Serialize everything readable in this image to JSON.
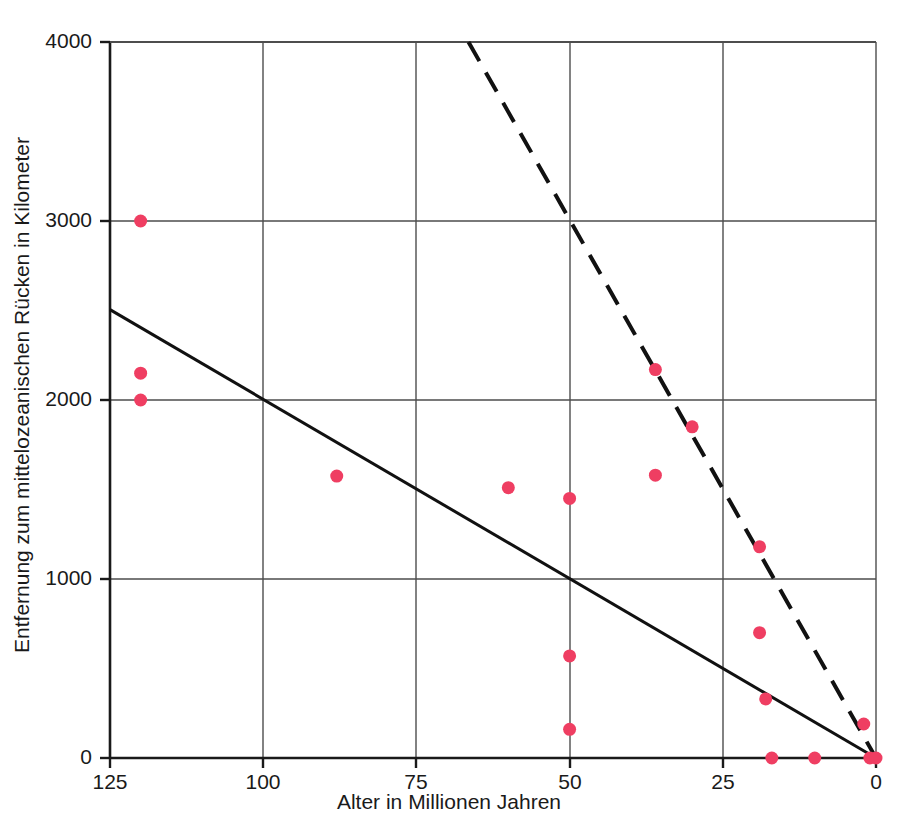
{
  "chart_data": {
    "type": "scatter",
    "title": "",
    "xlabel": "Alter in Millionen Jahren",
    "ylabel": "Entfernung zum mittelozeanischen Rücken in Kilometer",
    "xlim": [
      125,
      0
    ],
    "ylim": [
      0,
      4000
    ],
    "x_reversed": true,
    "grid": true,
    "legend": "none",
    "xticks": [
      125,
      100,
      75,
      50,
      25,
      0
    ],
    "xtick_labels": [
      "125",
      "100",
      "75",
      "50",
      "25",
      "0"
    ],
    "yticks": [
      0,
      1000,
      2000,
      3000,
      4000
    ],
    "ytick_labels": [
      "0",
      "1000",
      "2000",
      "3000",
      "4000"
    ],
    "marker_color": "#EF3E62",
    "marker_size": 13,
    "points": [
      {
        "x": 120,
        "y": 3000
      },
      {
        "x": 120,
        "y": 2150
      },
      {
        "x": 120,
        "y": 2000
      },
      {
        "x": 88,
        "y": 1575
      },
      {
        "x": 60,
        "y": 1510
      },
      {
        "x": 50,
        "y": 1450
      },
      {
        "x": 50,
        "y": 570
      },
      {
        "x": 50,
        "y": 160
      },
      {
        "x": 36,
        "y": 2170
      },
      {
        "x": 36,
        "y": 1580
      },
      {
        "x": 30,
        "y": 1850
      },
      {
        "x": 19,
        "y": 1180
      },
      {
        "x": 19,
        "y": 700
      },
      {
        "x": 18,
        "y": 330
      },
      {
        "x": 17,
        "y": 0
      },
      {
        "x": 10,
        "y": 0
      },
      {
        "x": 2,
        "y": 190
      },
      {
        "x": 1,
        "y": 0
      },
      {
        "x": 0,
        "y": 0
      }
    ],
    "series": [
      {
        "name": "solid-trend-line",
        "style": "solid",
        "color": "#111111",
        "width": 3,
        "x": [
          125,
          0
        ],
        "values": [
          2505,
          0
        ]
      },
      {
        "name": "dashed-trend-line",
        "style": "dashed",
        "color": "#111111",
        "width": 4,
        "x": [
          66.5,
          0
        ],
        "values": [
          4000,
          0
        ]
      }
    ],
    "annotations": []
  }
}
